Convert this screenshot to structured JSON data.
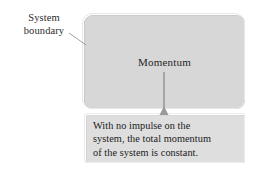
{
  "figure": {
    "type": "system-boundary-diagram",
    "background_color": "#ffffff"
  },
  "boundary_callout": {
    "name": "System boundary",
    "lines": [
      "System",
      "boundary"
    ],
    "leader_line": {
      "from": [
        73,
        35
      ],
      "to": [
        86,
        45
      ],
      "color": "#8a8a8a"
    }
  },
  "system_box": {
    "label": "Momentum",
    "fill_color": "#d7d7d7",
    "border_color": "#c0c0c0",
    "shape": "rounded-rectangle"
  },
  "connector": {
    "name": "arrow-connector",
    "from": [
      164,
      72
    ],
    "to": [
      164,
      114
    ],
    "arrowhead": "up",
    "color": "#8e8e8e"
  },
  "caption_box": {
    "fill_color": "#dedede",
    "border_color": "#cfcfcf",
    "text": "With no impulse on the system, the total momentum of the system is constant.",
    "lines": [
      "With no impulse on the",
      "system, the total momentum",
      "of the system is constant."
    ]
  }
}
